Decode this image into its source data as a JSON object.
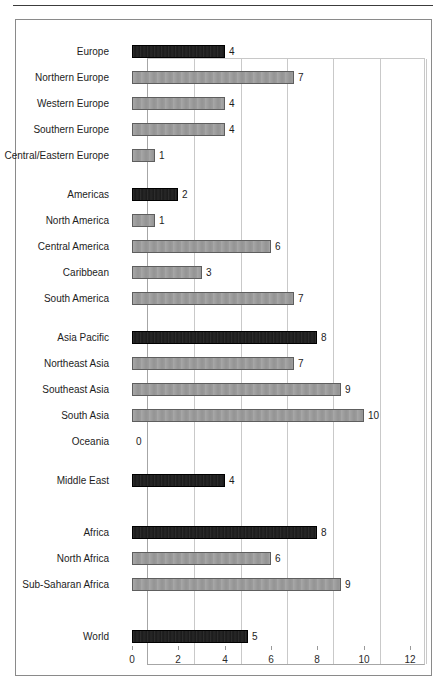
{
  "chart_data": {
    "type": "bar",
    "orientation": "horizontal",
    "title": "",
    "subtitle": "",
    "xlabel": "",
    "ylabel": "",
    "xlim": [
      0,
      12
    ],
    "xticks": [
      0,
      2,
      4,
      6,
      8,
      10,
      12
    ],
    "xtick_labels": [
      "0",
      "2",
      "4",
      "6",
      "8",
      "10",
      "12"
    ],
    "grid": true,
    "grid_axis": "x",
    "legend": null,
    "legend_position": "none",
    "categories": [
      "Europe",
      "Northern Europe",
      "Western Europe",
      "Southern Europe",
      "Central/Eastern Europe",
      "Americas",
      "North America",
      "Central America",
      "Caribbean",
      "South America",
      "Asia Pacific",
      "Northeast Asia",
      "Southeast Asia",
      "South Asia",
      "Oceania",
      "Middle East",
      "Africa",
      "North Africa",
      "Sub-Saharan Africa",
      "World"
    ],
    "values": [
      4,
      7,
      4,
      4,
      1,
      2,
      1,
      6,
      3,
      7,
      8,
      7,
      9,
      10,
      0,
      4,
      8,
      6,
      9,
      5
    ],
    "value_labels": [
      "4",
      "7",
      "4",
      "4",
      "1",
      "2",
      "1",
      "6",
      "3",
      "7",
      "8",
      "7",
      "9",
      "10",
      "0",
      "4",
      "8",
      "6",
      "9",
      "5"
    ],
    "bar_styles": [
      "dark",
      "gray",
      "gray",
      "gray",
      "gray",
      "dark",
      "gray",
      "gray",
      "gray",
      "gray",
      "dark",
      "gray",
      "gray",
      "gray",
      "gray",
      "dark",
      "dark",
      "gray",
      "gray",
      "dark"
    ],
    "colors": {
      "dark": "#1a1a1a",
      "gray": "#9c9c9c",
      "dark_border": "#000000",
      "gray_border": "#5e5e5e",
      "gridline": "#c9c9c9",
      "axis": "#a6a6a6",
      "text": "#1d1d1d",
      "figure_border": "#8a8a8a",
      "rule": "#3c3c3c"
    },
    "group_gaps_after": [
      4,
      9,
      14,
      15,
      18
    ]
  },
  "rows": [
    {
      "label": "Europe",
      "value": 4,
      "value_label": "4",
      "style": "dark",
      "y": 38
    },
    {
      "label": "Northern Europe",
      "value": 7,
      "value_label": "7",
      "style": "gray",
      "y": 64
    },
    {
      "label": "Western Europe",
      "value": 4,
      "value_label": "4",
      "style": "gray",
      "y": 90
    },
    {
      "label": "Southern Europe",
      "value": 4,
      "value_label": "4",
      "style": "gray",
      "y": 116
    },
    {
      "label": "Central/Eastern Europe",
      "value": 1,
      "value_label": "1",
      "style": "gray",
      "y": 142
    },
    {
      "label": "Americas",
      "value": 2,
      "value_label": "2",
      "style": "dark",
      "y": 181
    },
    {
      "label": "North America",
      "value": 1,
      "value_label": "1",
      "style": "gray",
      "y": 207
    },
    {
      "label": "Central America",
      "value": 6,
      "value_label": "6",
      "style": "gray",
      "y": 233
    },
    {
      "label": "Caribbean",
      "value": 3,
      "value_label": "3",
      "style": "gray",
      "y": 259
    },
    {
      "label": "South America",
      "value": 7,
      "value_label": "7",
      "style": "gray",
      "y": 285
    },
    {
      "label": "Asia Pacific",
      "value": 8,
      "value_label": "8",
      "style": "dark",
      "y": 324
    },
    {
      "label": "Northeast Asia",
      "value": 7,
      "value_label": "7",
      "style": "gray",
      "y": 350
    },
    {
      "label": "Southeast Asia",
      "value": 9,
      "value_label": "9",
      "style": "gray",
      "y": 376
    },
    {
      "label": "South Asia",
      "value": 10,
      "value_label": "10",
      "style": "gray",
      "y": 402
    },
    {
      "label": "Oceania",
      "value": 0,
      "value_label": "0",
      "style": "gray",
      "y": 428
    },
    {
      "label": "Middle East",
      "value": 4,
      "value_label": "4",
      "style": "dark",
      "y": 467
    },
    {
      "label": "Africa",
      "value": 8,
      "value_label": "8",
      "style": "dark",
      "y": 519
    },
    {
      "label": "North Africa",
      "value": 6,
      "value_label": "6",
      "style": "gray",
      "y": 545
    },
    {
      "label": "Sub-Saharan Africa",
      "value": 9,
      "value_label": "9",
      "style": "gray",
      "y": 571
    },
    {
      "label": "World",
      "value": 5,
      "value_label": "5",
      "style": "dark",
      "y": 623
    }
  ],
  "axis": {
    "ticks": [
      {
        "value": 0,
        "label": "0"
      },
      {
        "value": 2,
        "label": "2"
      },
      {
        "value": 4,
        "label": "4"
      },
      {
        "value": 6,
        "label": "6"
      },
      {
        "value": 8,
        "label": "8"
      },
      {
        "value": 10,
        "label": "10"
      },
      {
        "value": 12,
        "label": "12"
      }
    ]
  }
}
